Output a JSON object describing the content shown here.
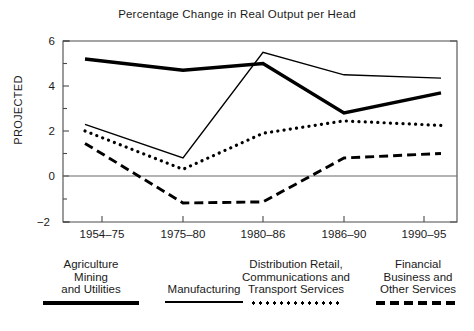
{
  "chart_data": {
    "type": "line",
    "title": "Percentage Change in Real Output per Head",
    "xlabel": "",
    "ylabel": "",
    "categories": [
      "1954–75",
      "1975–80",
      "1980–86",
      "1986–90",
      "1990–95"
    ],
    "ylim": [
      -2,
      6
    ],
    "yticks": [
      -2,
      0,
      2,
      4,
      6
    ],
    "ytick_labels": [
      "−2",
      "0",
      "2",
      "4",
      "6"
    ],
    "grid": false,
    "legend_position": "bottom",
    "zero_line": 0,
    "annotations": [
      {
        "text": "PROJECTED",
        "orientation": "vertical",
        "location": "y-axis-left"
      }
    ],
    "series": [
      {
        "name": "Agriculture Mining and Utilities",
        "style": "thick-solid",
        "values": [
          5.2,
          4.7,
          5.0,
          2.8,
          3.7
        ]
      },
      {
        "name": "Manufacturing",
        "style": "thin-solid",
        "values": [
          2.3,
          0.8,
          5.5,
          4.5,
          4.35
        ]
      },
      {
        "name": "Distribution Retail, Communications and Transport Services",
        "style": "dotted",
        "values": [
          2.0,
          0.3,
          1.9,
          2.45,
          2.25
        ]
      },
      {
        "name": "Financial Business and Other Services",
        "style": "dashed",
        "values": [
          1.45,
          -1.2,
          -1.15,
          0.8,
          1.0
        ]
      }
    ]
  },
  "axis": {
    "y_label_rotated": "PROJECTED",
    "ytick_labels": [
      "6",
      "4",
      "2",
      "0",
      "−2"
    ],
    "xtick_labels": [
      "1954–75",
      "1975–80",
      "1980–86",
      "1986–90",
      "1990–95"
    ]
  },
  "legend": {
    "items": [
      {
        "label": "Agriculture\nMining\nand Utilities",
        "style": "thick-solid"
      },
      {
        "label": "Manufacturing",
        "style": "thin-solid"
      },
      {
        "label": "Distribution Retail,\nCommunications and\nTransport Services",
        "style": "dotted"
      },
      {
        "label": "Financial\nBusiness and\nOther Services",
        "style": "dashed"
      }
    ]
  },
  "colors": {
    "ink": "#000000",
    "background": "#ffffff",
    "axis": "#555555"
  }
}
